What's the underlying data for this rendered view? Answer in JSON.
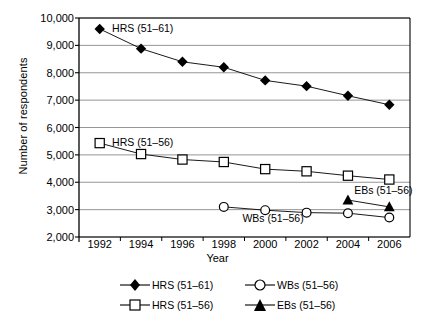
{
  "chart_data": {
    "type": "line",
    "title": "",
    "xlabel": "Year",
    "ylabel": "Number of respondents",
    "x": [
      1992,
      1994,
      1996,
      1998,
      2000,
      2002,
      2004,
      2006
    ],
    "xlim": [
      1991,
      2007
    ],
    "ylim": [
      2000,
      10000
    ],
    "ytick_labels": [
      "10,000",
      "9,000",
      "8,000",
      "7,000",
      "6,000",
      "5,000",
      "4,000",
      "3,000",
      "2,000"
    ],
    "ytick_values": [
      10000,
      9000,
      8000,
      7000,
      6000,
      5000,
      4000,
      3000,
      2000
    ],
    "xtick_labels": [
      "1992",
      "1994",
      "1996",
      "1998",
      "2000",
      "2002",
      "2004",
      "2006"
    ],
    "grid": true,
    "legend_position": "bottom",
    "series": [
      {
        "name": "HRS (51–61)",
        "marker": "filled-diamond",
        "x": [
          1992,
          1994,
          1996,
          1998,
          2000,
          2002,
          2004,
          2006
        ],
        "values": [
          9600,
          8880,
          8400,
          8200,
          7720,
          7510,
          7160,
          6830
        ]
      },
      {
        "name": "HRS (51–56)",
        "marker": "open-square",
        "x": [
          1992,
          1994,
          1996,
          1998,
          2000,
          2002,
          2004,
          2006
        ],
        "values": [
          5430,
          5030,
          4830,
          4740,
          4480,
          4400,
          4240,
          4100
        ]
      },
      {
        "name": "WBs (51–56)",
        "marker": "open-circle",
        "x": [
          1998,
          2000,
          2002,
          2004,
          2006
        ],
        "values": [
          3100,
          2980,
          2890,
          2870,
          2710
        ]
      },
      {
        "name": "EBs (51–56)",
        "marker": "filled-triangle",
        "x": [
          2004,
          2006
        ],
        "values": [
          3350,
          3100
        ]
      }
    ],
    "annotations": [
      {
        "text": "HRS (51–61)",
        "x": 1992.6,
        "y": 9600
      },
      {
        "text": "HRS (51–56)",
        "x": 1992.6,
        "y": 5430
      },
      {
        "text": "WBs (51–56)",
        "x": 1998.9,
        "y": 2650
      },
      {
        "text": "EBs (51–56)",
        "x": 2004.3,
        "y": 3680
      }
    ]
  },
  "legend": {
    "entries": [
      {
        "label": "HRS (51–61)",
        "marker": "filled-diamond"
      },
      {
        "label": "WBs (51–56)",
        "marker": "open-circle"
      },
      {
        "label": "HRS (51–56)",
        "marker": "open-square"
      },
      {
        "label": "EBs (51–56)",
        "marker": "filled-triangle"
      }
    ]
  }
}
